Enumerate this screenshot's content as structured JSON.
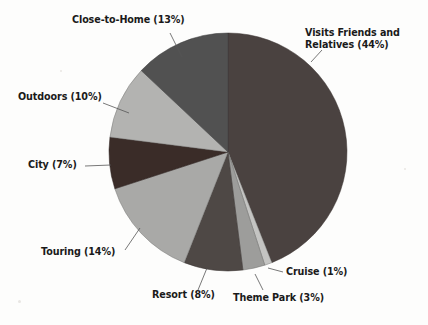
{
  "chart_data": {
    "type": "pie",
    "title": "",
    "subtitle": "",
    "xlabel": "",
    "ylabel": "",
    "legend_position": "none",
    "grid": false,
    "labels_include_percent": true,
    "start_angle_deg": 0,
    "direction": "clockwise",
    "categories": [
      "Visits Friends and Relatives",
      "Cruise",
      "Theme Park",
      "Resort",
      "Touring",
      "City",
      "Outdoors",
      "Close-to-Home"
    ],
    "values": [
      44,
      1,
      3,
      8,
      14,
      7,
      10,
      13
    ],
    "units": "percent",
    "slices": [
      {
        "name": "Visits Friends and Relatives",
        "value": 44,
        "label": "Visits Friends and Relatives (44%)",
        "color": "#4a4240"
      },
      {
        "name": "Cruise",
        "value": 1,
        "label": "Cruise (1%)",
        "color": "#c4c4c2"
      },
      {
        "name": "Theme Park",
        "value": 3,
        "label": "Theme Park (3%)",
        "color": "#9d9d9b"
      },
      {
        "name": "Resort",
        "value": 8,
        "label": "Resort (8%)",
        "color": "#4e4845"
      },
      {
        "name": "Touring",
        "value": 14,
        "label": "Touring (14%)",
        "color": "#a9a9a7"
      },
      {
        "name": "City",
        "value": 7,
        "label": "City (7%)",
        "color": "#3a2c28"
      },
      {
        "name": "Outdoors",
        "value": 10,
        "label": "Outdoors (10%)",
        "color": "#b3b3b1"
      },
      {
        "name": "Close-to-Home",
        "value": 13,
        "label": "Close-to-Home (13%)",
        "color": "#515151"
      }
    ]
  },
  "labels": {
    "vfr_line1": "Visits Friends and",
    "vfr_line2": "Relatives (44%)",
    "cruise": "Cruise (1%)",
    "theme_park": "Theme Park (3%)",
    "resort": "Resort (8%)",
    "touring": "Touring (14%)",
    "city": "City (7%)",
    "outdoors": "Outdoors (10%)",
    "close_to_home": "Close-to-Home (13%)"
  },
  "colors": {
    "background": "#fdfdfc",
    "text": "#1a1a1a",
    "leader_line": "#555555"
  }
}
